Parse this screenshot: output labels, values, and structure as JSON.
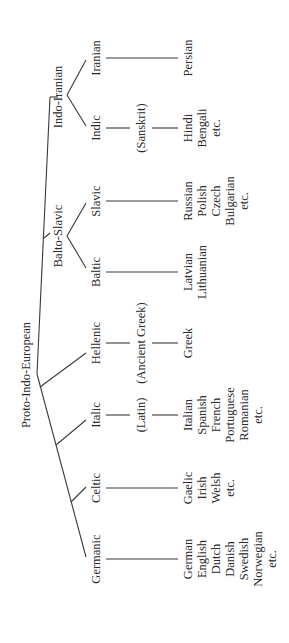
{
  "diagram": {
    "orientation": "rotated 90 degrees counter-clockwise",
    "root": "Proto-Indo-European",
    "intermediate": {
      "balto_slavic": "Balto-Slavic",
      "indo_iranian": "Indo-Iranian"
    },
    "branches": {
      "germanic": {
        "label": "Germanic",
        "modern": [
          "German",
          "English",
          "Dutch",
          "Danish",
          "Swedish",
          "Norwegian",
          "etc."
        ]
      },
      "celtic": {
        "label": "Celtic",
        "modern": [
          "Gaelic",
          "Irish",
          "Welsh",
          "etc."
        ]
      },
      "italic": {
        "label": "Italic",
        "ancient": "(Latin)",
        "modern": [
          "Italian",
          "Spanish",
          "French",
          "Portuguese",
          "Romanian",
          "etc."
        ]
      },
      "hellenic": {
        "label": "Hellenic",
        "ancient": "(Ancient Greek)",
        "modern": [
          "Greek"
        ]
      },
      "baltic": {
        "label": "Baltic",
        "modern": [
          "Latvian",
          "Lithuanian"
        ]
      },
      "slavic": {
        "label": "Slavic",
        "modern": [
          "Russian",
          "Polish",
          "Czech",
          "Bulgarian",
          "etc."
        ]
      },
      "indic": {
        "label": "Indic",
        "ancient": "(Sanskrit)",
        "modern": [
          "Hindi",
          "Bengali",
          "etc."
        ]
      },
      "iranian": {
        "label": "Iranian",
        "modern": [
          "Persian"
        ]
      }
    }
  }
}
